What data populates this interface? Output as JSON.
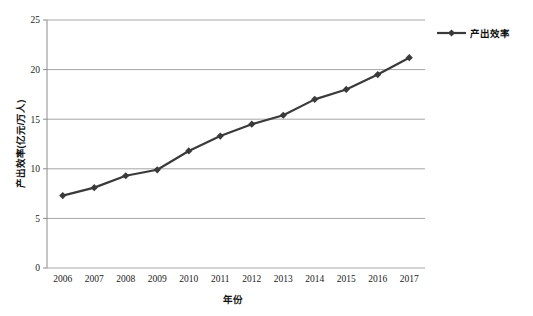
{
  "chart_data": {
    "type": "line",
    "title": "",
    "subtitle": "",
    "xlabel": "年份",
    "ylabel": "产出效率(亿元/万人)",
    "categories": [
      "2006",
      "2007",
      "2008",
      "2009",
      "2010",
      "2011",
      "2012",
      "2013",
      "2014",
      "2015",
      "2016",
      "2017"
    ],
    "series": [
      {
        "name": "产出效率",
        "values": [
          7.3,
          8.1,
          9.3,
          9.9,
          11.8,
          13.3,
          14.5,
          15.4,
          17.0,
          18.0,
          19.5,
          21.2
        ],
        "color": "#3a3a3a",
        "marker": "diamond"
      }
    ],
    "ylim": [
      0,
      25
    ],
    "yticks": [
      "0",
      "5",
      "10",
      "15",
      "20",
      "25"
    ],
    "ytick_values": [
      0,
      5,
      10,
      15,
      20,
      25
    ],
    "grid": "horizontal",
    "legend_position": "right-top",
    "legend_entries": [
      "产出效率"
    ],
    "background_color": "#ffffff",
    "gridline_color": "#a6a6a6",
    "axis_color": "#8c8c8c"
  },
  "legend": {
    "series_label": "产出效率"
  },
  "axes": {
    "x_title": "年份",
    "y_title": "产出效率(亿元/万人)"
  }
}
